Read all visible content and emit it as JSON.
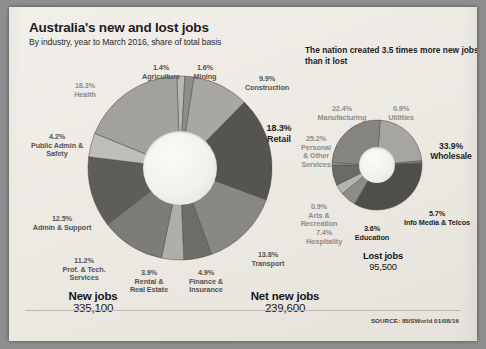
{
  "header": {
    "title": "Australia's new and lost jobs",
    "subtitle": "By industry, year to March 2016, share of total basis",
    "standfirst": "The nation created 3.5 times more new jobs than it lost"
  },
  "totals": {
    "new_jobs_label": "New jobs",
    "new_jobs_value": "335,100",
    "net_new_jobs_label": "Net new jobs",
    "net_new_jobs_value": "239,600",
    "lost_jobs_label": "Lost jobs",
    "lost_jobs_value": "95,500"
  },
  "footer": {
    "source": "SOURCE: IBISWorld 01/08/16"
  },
  "chart_data": [
    {
      "type": "pie",
      "title": "New jobs",
      "total_label": "335,100",
      "unit": "%",
      "categories": [
        "Agriculture",
        "Mining",
        "Construction",
        "Retail",
        "Transport",
        "Finance & Insurance",
        "Rental & Real Estate",
        "Prof. & Tech. Services",
        "Admin & Support",
        "Public Admin & Safety",
        "Health"
      ],
      "values": [
        1.4,
        1.6,
        9.9,
        18.3,
        13.8,
        4.9,
        3.9,
        11.2,
        12.5,
        4.2,
        18.3
      ],
      "colors": [
        "#b9b7b2",
        "#8f8d88",
        "#a9a7a1",
        "#55544f",
        "#8a8884",
        "#6f6d68",
        "#b0aea8",
        "#7e7c77",
        "#5e5d58",
        "#c0beb8",
        "#a3a19b"
      ],
      "legend_position": "around",
      "grid": false
    },
    {
      "type": "pie",
      "title": "Lost jobs",
      "total_label": "95,500",
      "unit": "%",
      "categories": [
        "Manufacturing",
        "Utilities",
        "Wholesale",
        "Info Media & Telcos",
        "Education",
        "Hospitality",
        "Arts & Recreation",
        "Personal & Other Services"
      ],
      "values": [
        22.4,
        0.9,
        33.9,
        5.7,
        3.6,
        7.4,
        0.9,
        25.2
      ],
      "colors": [
        "#a7a5a0",
        "#7c7a75",
        "#4f4e49",
        "#8e8c87",
        "#b6b4ae",
        "#6c6a65",
        "#98968f",
        "#87857f"
      ],
      "legend_position": "around",
      "grid": false
    }
  ],
  "labels_new": [
    {
      "pct": "1.4%",
      "name": "Agriculture"
    },
    {
      "pct": "1.6%",
      "name": "Mining"
    },
    {
      "pct": "9.9%",
      "name": "Construction"
    },
    {
      "pct": "18.3%",
      "name": "Retail"
    },
    {
      "pct": "13.8%",
      "name": "Transport"
    },
    {
      "pct": "4.9%",
      "name": "Finance & Insurance"
    },
    {
      "pct": "3.9%",
      "name": "Rental & Real Estate"
    },
    {
      "pct": "11.2%",
      "name": "Prof. & Tech. Services"
    },
    {
      "pct": "12.5%",
      "name": "Admin & Support"
    },
    {
      "pct": "4.2%",
      "name": "Public Admin & Safety"
    },
    {
      "pct": "18.3%",
      "name": "Health"
    }
  ],
  "labels_lost": [
    {
      "pct": "22.4%",
      "name": "Manufacturing"
    },
    {
      "pct": "0.9%",
      "name": "Utilities"
    },
    {
      "pct": "33.9%",
      "name": "Wholesale"
    },
    {
      "pct": "5.7%",
      "name": "Info Media & Telcos"
    },
    {
      "pct": "3.6%",
      "name": "Education"
    },
    {
      "pct": "7.4%",
      "name": "Hospitality"
    },
    {
      "pct": "0.9%",
      "name": "Arts & Recreation"
    },
    {
      "pct": "25.2%",
      "name": "Personal & Other Services"
    }
  ],
  "label_text": {
    "agriculture_pct": "1.4%",
    "agriculture_nm": "Agriculture",
    "mining_pct": "1.6%",
    "mining_nm": "Mining",
    "construction_pct": "9.9%",
    "construction_nm": "Construction",
    "retail_pct": "18.3%",
    "retail_nm": "Retail",
    "transport_pct": "13.8%",
    "transport_nm": "Transport",
    "finance_pct": "4.9%",
    "finance_nm1": "Finance &",
    "finance_nm2": "Insurance",
    "rental_pct": "3.9%",
    "rental_nm1": "Rental &",
    "rental_nm2": "Real Estate",
    "prof_pct": "11.2%",
    "prof_nm1": "Prof. & Tech.",
    "prof_nm2": "Services",
    "admin_pct": "12.5%",
    "admin_nm": "Admin & Support",
    "public_pct": "4.2%",
    "public_nm1": "Public Admin &",
    "public_nm2": "Safety",
    "health_pct": "18.3%",
    "health_nm": "Health",
    "manufacturing_pct": "22.4%",
    "manufacturing_nm": "Manufacturing",
    "utilities_pct": "0.9%",
    "utilities_nm": "Utilities",
    "wholesale_pct": "33.9%",
    "wholesale_nm": "Wholesale",
    "infomedia_pct": "5.7%",
    "infomedia_nm": "Info Media & Telcos",
    "education_pct": "3.6%",
    "education_nm": "Education",
    "hospitality_pct": "7.4%",
    "hospitality_nm": "Hospitality",
    "arts_pct": "0.9%",
    "arts_nm1": "Arts &",
    "arts_nm2": "Recreation",
    "personal_pct": "25.2%",
    "personal_nm1": "Personal",
    "personal_nm2": "& Other",
    "personal_nm3": "Services"
  }
}
